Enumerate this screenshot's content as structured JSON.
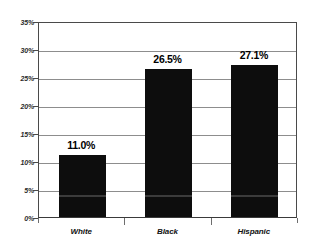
{
  "chart_data": {
    "type": "bar",
    "title": "",
    "subtitle": "",
    "xlabel": "",
    "ylabel": "",
    "categories": [
      "White",
      "Black",
      "Hispanic"
    ],
    "values": [
      11.0,
      26.5,
      27.1
    ],
    "value_labels": [
      "11.0%",
      "26.5%",
      "27.1%"
    ],
    "series": [
      {
        "name": "",
        "values": [
          11.0,
          26.5,
          27.1
        ]
      }
    ],
    "ylim": [
      0,
      35
    ],
    "ytick_values": [
      0,
      5,
      10,
      15,
      20,
      25,
      30,
      35
    ],
    "ytick_labels": [
      "0%",
      "5%",
      "10%",
      "15%",
      "20%",
      "25%",
      "30%",
      "35%"
    ],
    "grid": true,
    "grid_axis": "y",
    "legend": false,
    "legend_position": "none",
    "bar_color": "#0d0d0d",
    "gridline_color": "#8d8d8d",
    "axis_color": "#4a4a4a",
    "background_color": "#ffffff",
    "text_color": "#000000"
  }
}
